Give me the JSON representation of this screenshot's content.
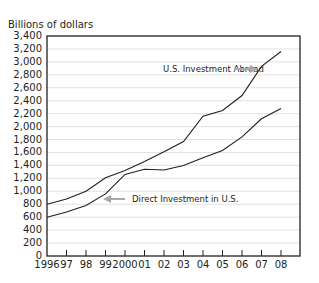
{
  "chart_data": {
    "type": "line",
    "title": "",
    "xlabel": "",
    "ylabel": "Billions of dollars",
    "ylim": [
      0,
      3400
    ],
    "yticks": [
      0,
      200,
      400,
      600,
      800,
      1000,
      1200,
      1400,
      1600,
      1800,
      2000,
      2200,
      2400,
      2600,
      2800,
      3000,
      3200,
      3400
    ],
    "ytick_labels": [
      "0",
      "200",
      "400",
      "600",
      "800",
      "1,000",
      "1,200",
      "1,400",
      "1,600",
      "1,800",
      "2,000",
      "2,200",
      "2,400",
      "2,600",
      "2,800",
      "3,000",
      "3,200",
      "3,400"
    ],
    "categories": [
      "1996",
      "97",
      "98",
      "99",
      "2000",
      "01",
      "02",
      "03",
      "04",
      "05",
      "06",
      "07",
      "08"
    ],
    "grid": true,
    "legend_position": "inline annotations with arrows",
    "series": [
      {
        "name": "U.S. Investment Abroad",
        "values": [
          800,
          880,
          1000,
          1210,
          1320,
          1460,
          1610,
          1770,
          2160,
          2250,
          2480,
          2930,
          3160
        ]
      },
      {
        "name": "Direct Investment in U.S.",
        "values": [
          600,
          680,
          780,
          960,
          1260,
          1340,
          1330,
          1400,
          1520,
          1630,
          1840,
          2120,
          2280
        ]
      }
    ],
    "annotations": [
      {
        "text": "U.S. Investment Abroad",
        "arrow": "right",
        "points_to": "07"
      },
      {
        "text": "Direct Investment in U.S.",
        "arrow": "left",
        "points_to": "99"
      }
    ]
  },
  "colors": {
    "line": "#231f20",
    "grid": "#d9d9d9",
    "arrow": "#a7a9ac",
    "axis": "#231f20"
  }
}
